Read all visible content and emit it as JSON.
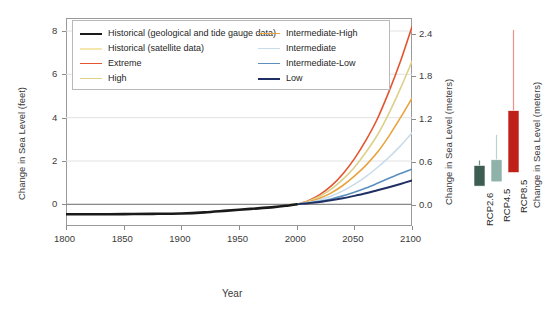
{
  "chart_data": {
    "type": "line",
    "title": "",
    "xlabel": "Year",
    "ylabel": "Change in Sea Level (feet)",
    "ylabel_right": "Change in Sea Level (meters)",
    "xlim": [
      1800,
      2100
    ],
    "ylim": [
      -1.0,
      8.6
    ],
    "ylim_meters": [
      -0.3,
      2.62
    ],
    "xticks": [
      1800,
      1850,
      1900,
      1950,
      2000,
      2050,
      2100
    ],
    "yticks_feet": [
      0,
      2,
      4,
      6,
      8
    ],
    "yticks_meters": [
      0.0,
      0.6,
      1.2,
      1.8,
      2.4
    ],
    "grid": true,
    "legend_position": "top-center",
    "series": [
      {
        "name": "Historical (geological and tide gauge data)",
        "color": "#1a1a1a",
        "width": 2.6,
        "x": [
          1800,
          1825,
          1850,
          1875,
          1900,
          1920,
          1940,
          1960,
          1980,
          1993,
          2000
        ],
        "values": [
          -0.46,
          -0.46,
          -0.45,
          -0.44,
          -0.42,
          -0.37,
          -0.29,
          -0.21,
          -0.13,
          -0.05,
          0.0
        ]
      },
      {
        "name": "Historical (satellite data)",
        "color": "#f5e6b0",
        "width": 2.2,
        "x": [
          1993,
          1996,
          2000
        ],
        "values": [
          -0.05,
          -0.03,
          0.0
        ]
      },
      {
        "name": "Extreme",
        "color": "#e4542e",
        "width": 1.6,
        "x": [
          2000,
          2010,
          2020,
          2030,
          2040,
          2050,
          2060,
          2070,
          2080,
          2090,
          2100
        ],
        "values": [
          0.0,
          0.17,
          0.45,
          0.85,
          1.4,
          2.1,
          2.95,
          3.95,
          5.2,
          6.6,
          8.2
        ]
      },
      {
        "name": "High",
        "color": "#ddd08a",
        "width": 1.6,
        "x": [
          2000,
          2010,
          2020,
          2030,
          2040,
          2050,
          2060,
          2070,
          2080,
          2090,
          2100
        ],
        "values": [
          0.0,
          0.14,
          0.37,
          0.7,
          1.15,
          1.7,
          2.4,
          3.2,
          4.2,
          5.35,
          6.6
        ]
      },
      {
        "name": "Intermediate-High",
        "color": "#e8a33d",
        "width": 1.6,
        "x": [
          2000,
          2010,
          2020,
          2030,
          2040,
          2050,
          2060,
          2070,
          2080,
          2090,
          2100
        ],
        "values": [
          0.0,
          0.11,
          0.28,
          0.53,
          0.87,
          1.3,
          1.8,
          2.4,
          3.15,
          4.0,
          4.9
        ]
      },
      {
        "name": "Intermediate",
        "color": "#c8dcec",
        "width": 1.6,
        "x": [
          2000,
          2010,
          2020,
          2030,
          2040,
          2050,
          2060,
          2070,
          2080,
          2090,
          2100
        ],
        "values": [
          0.0,
          0.08,
          0.2,
          0.38,
          0.62,
          0.92,
          1.28,
          1.7,
          2.17,
          2.7,
          3.3
        ]
      },
      {
        "name": "Intermediate-Low",
        "color": "#5b8fc0",
        "width": 1.6,
        "x": [
          2000,
          2010,
          2020,
          2030,
          2040,
          2050,
          2060,
          2070,
          2080,
          2090,
          2100
        ],
        "values": [
          0.0,
          0.06,
          0.14,
          0.25,
          0.39,
          0.56,
          0.75,
          0.97,
          1.2,
          1.42,
          1.62
        ]
      },
      {
        "name": "Low",
        "color": "#1f2f63",
        "width": 1.9,
        "x": [
          2000,
          2010,
          2020,
          2030,
          2040,
          2050,
          2060,
          2070,
          2080,
          2090,
          2100
        ],
        "values": [
          0.0,
          0.05,
          0.11,
          0.19,
          0.28,
          0.39,
          0.51,
          0.65,
          0.79,
          0.94,
          1.1
        ]
      }
    ],
    "inset_chart": {
      "type": "bar",
      "ylabel": "Change in Sea Level (meters)",
      "categories": [
        "RCP2.6",
        "RCP4.5",
        "RCP8.5"
      ],
      "colors": [
        "#3d5d52",
        "#8fb3aa",
        "#c0201a"
      ],
      "whisker_colors": [
        "#6f8f84",
        "#b8d2cc",
        "#e8928a"
      ],
      "bar_low": [
        0.26,
        0.32,
        0.45
      ],
      "bar_high": [
        0.55,
        0.63,
        1.32
      ],
      "whisker_low": [
        0.26,
        0.32,
        0.45
      ],
      "whisker_high": [
        0.62,
        0.98,
        2.45
      ]
    }
  },
  "legend": {
    "columns": [
      {
        "items": [
          {
            "label": "Historical (geological and tide gauge data)",
            "color": "#1a1a1a",
            "width": 2.6
          },
          {
            "label": "Historical (satellite data)",
            "color": "#f5e6b0",
            "width": 2.0
          },
          {
            "label": "Extreme",
            "color": "#e4542e",
            "width": 1.8
          },
          {
            "label": "High",
            "color": "#ddd08a",
            "width": 1.8
          }
        ]
      },
      {
        "items": [
          {
            "label": "Intermediate-High",
            "color": "#e8a33d",
            "width": 1.8
          },
          {
            "label": "Intermediate",
            "color": "#c8dcec",
            "width": 1.8
          },
          {
            "label": "Intermediate-Low",
            "color": "#5b8fc0",
            "width": 1.8
          },
          {
            "label": "Low",
            "color": "#1f2f63",
            "width": 2.6
          }
        ]
      }
    ]
  },
  "axes": {
    "left_title": "Change in Sea Level (feet)",
    "right_title": "Change in Sea Level (meters)",
    "x_title": "Year",
    "inset_title": "Change in Sea Level (meters)"
  }
}
